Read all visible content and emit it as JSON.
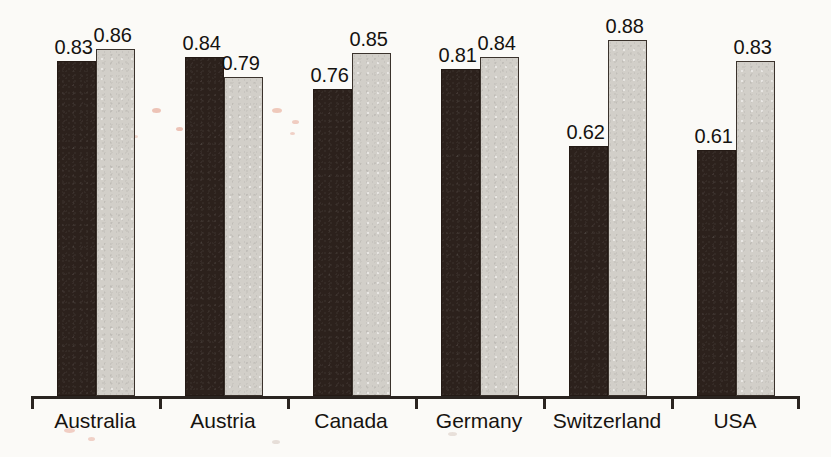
{
  "chart_data": {
    "type": "bar",
    "title": "",
    "subtitle": "",
    "xlabel": "",
    "ylabel": "",
    "ylim": [
      0,
      0.98
    ],
    "grid": false,
    "legend_position": "none",
    "value_labels_shown": true,
    "axis_tick_labels_shown": false,
    "categories": [
      "Australia",
      "Austria",
      "Canada",
      "Germany",
      "Switzerland",
      "USA"
    ],
    "series": [
      {
        "name": "series-1-dark",
        "color": "#2c211c",
        "values": [
          0.83,
          0.84,
          0.76,
          0.81,
          0.62,
          0.61
        ],
        "labels": [
          "0.83",
          "0.84",
          "0.76",
          "0.81",
          "0.62",
          "0.61"
        ]
      },
      {
        "name": "series-2-light",
        "color": "#d2cfc9",
        "values": [
          0.86,
          0.79,
          0.85,
          0.84,
          0.88,
          0.83
        ],
        "labels": [
          "0.86",
          "0.79",
          "0.85",
          "0.84",
          "0.88",
          "0.83"
        ]
      }
    ]
  },
  "axis": {
    "baseline_color": "#2a2420",
    "tick_count": 7
  },
  "colors": {
    "background": "#fbfaf7",
    "dark_bar": "#2c211c",
    "light_bar": "#d2cfc9",
    "outline": "#2a2420",
    "text": "#15120f"
  }
}
